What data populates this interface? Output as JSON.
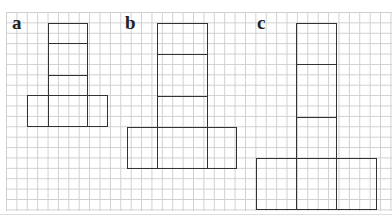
{
  "figures": [
    {
      "label": "a",
      "tower_sections": 3,
      "base_sections": 3
    },
    {
      "label": "b",
      "tower_sections": 3,
      "base_sections": 3
    },
    {
      "label": "c",
      "tower_sections": 3,
      "base_sections": 3
    }
  ],
  "colors": {
    "grid": "#cfcfcf",
    "lines": "#333333",
    "background": "#ffffff"
  }
}
